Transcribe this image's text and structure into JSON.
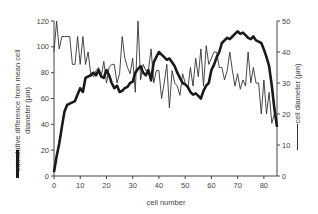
{
  "chart_data": {
    "type": "line",
    "title": "",
    "xlabel": "cell number",
    "ylabel_left": "cumulative difference from mean cell diameter (µm)",
    "ylabel_right": "cell diameter (µm)",
    "xlim": [
      0,
      85
    ],
    "ylim_left": [
      0,
      120
    ],
    "ylim_right": [
      0,
      50
    ],
    "x_ticks": [
      0,
      10,
      20,
      30,
      40,
      50,
      60,
      70,
      80
    ],
    "y_ticks_left": [
      0,
      20,
      40,
      60,
      80,
      100,
      120
    ],
    "y_ticks_right": [
      0,
      10,
      20,
      30,
      40,
      50
    ],
    "grid": false,
    "legend": "inline axis-title markers (thick bar = left axis, thin bar = right axis)",
    "series": [
      {
        "name": "cumulative difference from mean cell diameter (µm)",
        "axis": "left",
        "style": "thick",
        "x": [
          0,
          1,
          2,
          3,
          4,
          5,
          6,
          7,
          8,
          9,
          10,
          11,
          12,
          13,
          14,
          15,
          16,
          17,
          18,
          19,
          20,
          21,
          22,
          23,
          24,
          25,
          26,
          27,
          28,
          29,
          30,
          31,
          32,
          33,
          34,
          35,
          36,
          37,
          38,
          39,
          40,
          41,
          42,
          43,
          44,
          45,
          46,
          47,
          48,
          49,
          50,
          51,
          52,
          53,
          54,
          55,
          56,
          57,
          58,
          59,
          60,
          61,
          62,
          63,
          64,
          65,
          66,
          67,
          68,
          69,
          70,
          71,
          72,
          73,
          74,
          75,
          76,
          77,
          78,
          79,
          80,
          81,
          82,
          83,
          84,
          85
        ],
        "y": [
          3,
          15,
          25,
          38,
          50,
          55,
          56,
          57,
          58,
          63,
          68,
          65,
          76,
          77,
          78,
          80,
          78,
          82,
          77,
          76,
          82,
          78,
          72,
          68,
          70,
          65,
          66,
          68,
          69,
          72,
          73,
          80,
          83,
          85,
          80,
          78,
          82,
          74,
          88,
          92,
          96,
          94,
          92,
          90,
          91,
          88,
          85,
          80,
          76,
          72,
          71,
          69,
          65,
          63,
          64,
          62,
          60,
          66,
          70,
          72,
          82,
          86,
          92,
          96,
          103,
          105,
          107,
          106,
          108,
          110,
          112,
          110,
          111,
          109,
          107,
          106,
          108,
          105,
          104,
          103,
          98,
          92,
          85,
          70,
          52,
          38
        ]
      },
      {
        "name": "cell diameter (µm)",
        "axis": "right",
        "style": "thin",
        "x": [
          0,
          1,
          2,
          3,
          4,
          5,
          6,
          7,
          8,
          9,
          10,
          11,
          12,
          13,
          14,
          15,
          16,
          17,
          18,
          19,
          20,
          21,
          22,
          23,
          24,
          25,
          26,
          27,
          28,
          29,
          30,
          31,
          32,
          33,
          34,
          35,
          36,
          37,
          38,
          39,
          40,
          41,
          42,
          43,
          44,
          45,
          46,
          47,
          48,
          49,
          50,
          51,
          52,
          53,
          54,
          55,
          56,
          57,
          58,
          59,
          60,
          61,
          62,
          63,
          64,
          65,
          66,
          67,
          68,
          69,
          70,
          71,
          72,
          73,
          74,
          75,
          76,
          77,
          78,
          79,
          80,
          81,
          82,
          83,
          84,
          85
        ],
        "y": [
          40,
          50,
          41,
          45,
          45,
          45,
          45,
          36,
          36,
          45,
          36,
          45,
          36,
          40,
          33,
          32,
          34,
          35,
          32,
          37,
          30,
          35,
          36,
          36,
          30,
          33,
          45,
          38,
          35,
          33,
          38,
          27,
          50,
          31,
          36,
          34,
          34,
          41,
          30,
          34,
          34,
          25,
          30,
          36,
          22,
          34,
          30,
          29,
          26,
          33,
          30,
          28,
          35,
          29,
          38,
          32,
          41,
          29,
          42,
          36,
          38,
          40,
          40,
          35,
          35,
          31,
          34,
          40,
          34,
          29,
          33,
          28,
          31,
          29,
          40,
          30,
          35,
          30,
          30,
          20,
          31,
          20,
          27,
          17,
          20,
          18
        ]
      }
    ],
    "colors": {
      "thick_line": "#1a1a1a",
      "thin_line": "#333333",
      "axis": "#444444"
    }
  }
}
